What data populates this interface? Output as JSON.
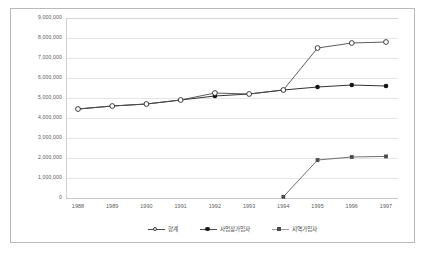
{
  "chart_data": {
    "type": "line",
    "title": "",
    "subtitle": "",
    "xlabel": "",
    "ylabel": "",
    "categories": [
      "1988",
      "1989",
      "1990",
      "1991",
      "1992",
      "1993",
      "1994",
      "1995",
      "1996",
      "1997"
    ],
    "x": [
      1988,
      1989,
      1990,
      1991,
      1992,
      1993,
      1994,
      1995,
      1996,
      1997
    ],
    "ylim": [
      0,
      9000000
    ],
    "ytick_values": [
      0,
      1000000,
      2000000,
      3000000,
      4000000,
      5000000,
      6000000,
      7000000,
      8000000,
      9000000
    ],
    "ytick_labels": [
      "0",
      "1,000,000",
      "2,000,000",
      "3,000,000",
      "4,000,000",
      "5,000,000",
      "6,000,000",
      "7,000,000",
      "8,000,000",
      "9,000,000"
    ],
    "grid": true,
    "grid_axis": "y",
    "legend_position": "bottom",
    "series": [
      {
        "name": "합계",
        "marker": "open-circle",
        "color": "#4a4a4a",
        "values": [
          4450000,
          4600000,
          4700000,
          4900000,
          5250000,
          5200000,
          5400000,
          7500000,
          7750000,
          7800000
        ]
      },
      {
        "name": "사업장가입자",
        "marker": "filled-circle",
        "color": "#1c1c1c",
        "values": [
          4450000,
          4600000,
          4700000,
          4900000,
          5100000,
          5200000,
          5400000,
          5550000,
          5650000,
          5600000
        ]
      },
      {
        "name": "지역가입자",
        "marker": "filled-square",
        "color": "#4a4a4a",
        "values": [
          null,
          null,
          null,
          null,
          null,
          null,
          60000,
          1900000,
          2050000,
          2080000
        ]
      }
    ]
  },
  "colors": {
    "frame": "#b9b9b9",
    "grid": "#e4e4e4",
    "axis": "#c9c9c9",
    "text": "#5a5a5a",
    "background": "#ffffff"
  }
}
